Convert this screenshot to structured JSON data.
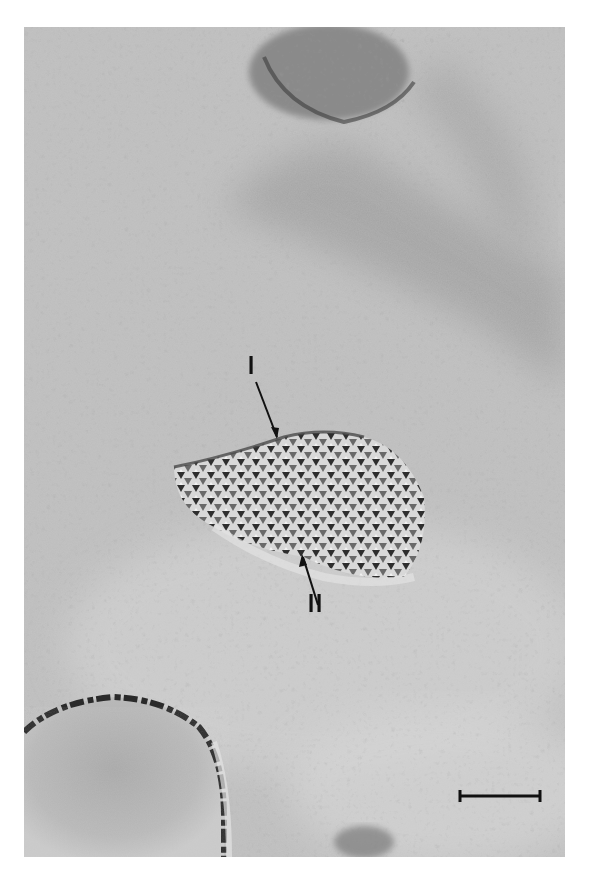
{
  "figure": {
    "type": "freeze-fracture electron micrograph",
    "colors": {
      "background": "#ffffff",
      "surface": "#b9b9b9",
      "dark_band": "#9c9c9c",
      "particles": "#3a3a3a",
      "highlight": "#e8e8e8"
    },
    "labels": {
      "upper_arrow": "I",
      "lower_arrow": "II"
    },
    "scale_bar": {
      "label": "",
      "x1": 460,
      "x2": 540,
      "y": 796
    },
    "structures": [
      "particle array (crystalline patch)",
      "upper dense granular region",
      "lower-left spherical vesicle",
      "bottom granular fragment"
    ]
  }
}
